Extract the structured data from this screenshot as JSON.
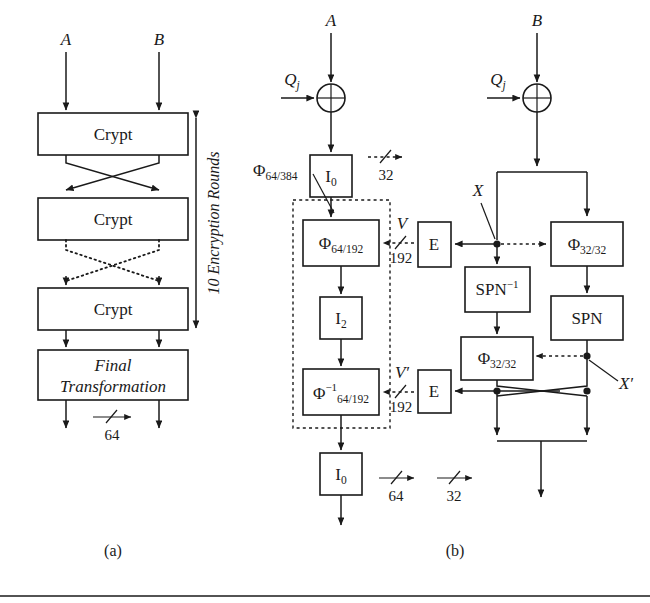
{
  "figure": {
    "panel_a": {
      "caption": "(a)",
      "inputs": [
        {
          "name": "input-a",
          "label": "A"
        },
        {
          "name": "input-b",
          "label": "B"
        }
      ],
      "blocks": [
        {
          "name": "crypt-1",
          "label": "Crypt"
        },
        {
          "name": "crypt-2",
          "label": "Crypt"
        },
        {
          "name": "crypt-3",
          "label": "Crypt"
        },
        {
          "name": "final-transformation",
          "label_line1": "Final",
          "label_line2": "Transformation"
        }
      ],
      "rounds_annotation": "10 Encryption Rounds",
      "bus_width_label": "64"
    },
    "panel_b": {
      "caption": "(b)",
      "inputs": [
        {
          "name": "input-a",
          "label": "A"
        },
        {
          "name": "input-b",
          "label": "B"
        }
      ],
      "xor_operators": [
        {
          "name": "xor-left",
          "key_label": "Q",
          "key_sub": "j",
          "glyph": "plus-circle"
        },
        {
          "name": "xor-right",
          "key_label": "Q",
          "key_sub": "j",
          "glyph": "plus-circle"
        }
      ],
      "blocks": [
        {
          "name": "block-i0-top",
          "label": "I",
          "sub": "0"
        },
        {
          "name": "block-phi-64-192",
          "label": "Φ",
          "sub": "64/192"
        },
        {
          "name": "block-i2",
          "label": "I",
          "sub": "2"
        },
        {
          "name": "block-phi-inv-64-192",
          "label": "Φ",
          "sub": "64/192",
          "sup": "−1"
        },
        {
          "name": "block-i0-bottom",
          "label": "I",
          "sub": "0"
        },
        {
          "name": "block-e-top",
          "label": "E"
        },
        {
          "name": "block-e-bottom",
          "label": "E"
        },
        {
          "name": "block-spn-inverse",
          "label": "SPN",
          "sup": "−1"
        },
        {
          "name": "block-phi-32-32-left",
          "label": "Φ",
          "sub": "32/32"
        },
        {
          "name": "block-phi-32-32-right",
          "label": "Φ",
          "sub": "32/32"
        },
        {
          "name": "block-spn",
          "label": "SPN"
        }
      ],
      "group_label": {
        "name": "phi-64-384-label",
        "label": "Φ",
        "sub": "64/384"
      },
      "signal_labels": [
        {
          "name": "signal-v",
          "label": "V",
          "width": "192"
        },
        {
          "name": "signal-v-prime",
          "label": "V′",
          "width": "192"
        },
        {
          "name": "signal-x",
          "label": "X"
        },
        {
          "name": "signal-x-prime",
          "label": "X′"
        }
      ],
      "legend": [
        {
          "name": "legend-32-dashed",
          "label": "32",
          "style": "dashed"
        },
        {
          "name": "legend-64-solid",
          "label": "64",
          "style": "solid"
        },
        {
          "name": "legend-32-solid",
          "label": "32",
          "style": "solid"
        }
      ]
    }
  }
}
